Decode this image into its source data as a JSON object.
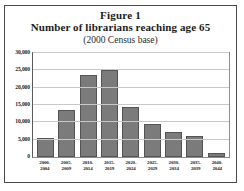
{
  "figure": {
    "title_line_1": "Figure 1",
    "title_line_2": "Number of librarians reaching age 65",
    "title_line_3": "(2000 Census base)"
  },
  "chart_data": {
    "type": "bar",
    "subtitle": "(2000 Census base)",
    "xlabel": "",
    "ylabel": "",
    "ylim": [
      0,
      30000
    ],
    "grid": true,
    "legend": "none",
    "categories": [
      "2000-2004",
      "2005-2009",
      "2010-2014",
      "2015-2019",
      "2020-2024",
      "2025-2029",
      "2030-2034",
      "2035-2039",
      "2040-2044"
    ],
    "category_lines": [
      [
        "2000-",
        "2004"
      ],
      [
        "2005-",
        "2009"
      ],
      [
        "2010-",
        "2014"
      ],
      [
        "2015-",
        "2019"
      ],
      [
        "2020-",
        "2024"
      ],
      [
        "2025-",
        "2029"
      ],
      [
        "2030-",
        "2034"
      ],
      [
        "2035-",
        "2039"
      ],
      [
        "2040-",
        "2044"
      ]
    ],
    "values": [
      5500,
      13500,
      23800,
      25200,
      14500,
      9500,
      7300,
      6000,
      1200
    ],
    "yticks": [
      0,
      5000,
      10000,
      15000,
      20000,
      25000,
      30000
    ],
    "ytick_labels": [
      "0",
      "5,000",
      "10,000",
      "15,000",
      "20,000",
      "25,000",
      "30,000"
    ],
    "bar_color": "#7b7b7b",
    "bar_border_color": "#545454",
    "grid_color": "#c8c8c8",
    "frame_color": "#4a4a4a"
  }
}
